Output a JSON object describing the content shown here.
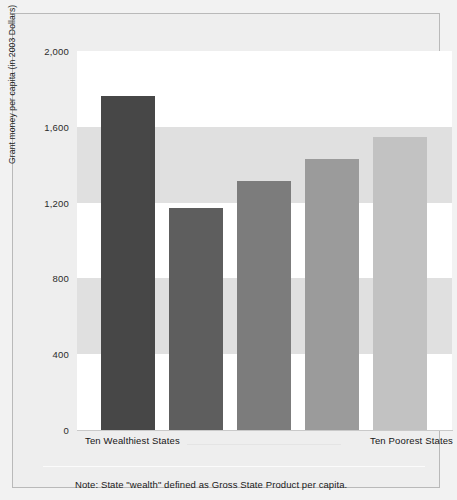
{
  "chart_data": {
    "type": "bar",
    "title": "",
    "xlabel": "",
    "ylabel": "Grant money per capita (in 2003 Dollars)",
    "ylim": [
      0,
      2000
    ],
    "yticks": [
      "0",
      "400",
      "800",
      "1,200",
      "1,600",
      "2,000"
    ],
    "ytick_values": [
      0,
      400,
      800,
      1200,
      1600,
      2000
    ],
    "grid": "horizontal alternating bands",
    "legend": "none",
    "categories": [
      "Ten Wealthiest States",
      "",
      "",
      "",
      "Ten Poorest States"
    ],
    "axis_endpoint_labels": {
      "left": "Ten Wealthiest States",
      "right": "Ten Poorest States"
    },
    "values": [
      1760,
      1170,
      1315,
      1430,
      1545
    ],
    "bar_colors": [
      "#474747",
      "#5e5e5e",
      "#7c7c7c",
      "#9b9b9b",
      "#c2c2c2"
    ],
    "bars": [
      {
        "value": 1760,
        "color": "#474747"
      },
      {
        "value": 1170,
        "color": "#5e5e5e"
      },
      {
        "value": 1315,
        "color": "#7c7c7c"
      },
      {
        "value": 1430,
        "color": "#9b9b9b"
      },
      {
        "value": 1545,
        "color": "#c2c2c2"
      }
    ],
    "bands": [
      {
        "from": 1600,
        "to": 2000,
        "color": "#ffffff"
      },
      {
        "from": 1200,
        "to": 1600,
        "color": "#e0e0e0"
      },
      {
        "from": 800,
        "to": 1200,
        "color": "#ffffff"
      },
      {
        "from": 400,
        "to": 800,
        "color": "#e0e0e0"
      },
      {
        "from": 0,
        "to": 400,
        "color": "#ffffff"
      }
    ],
    "annotations": [
      "Note: State \"wealth\" defined as Gross State Product per capita."
    ]
  },
  "note": "Note: State \"wealth\" defined as Gross State Product per capita.",
  "colors": {
    "figure_background": "#f2f2f2",
    "panel_background": "#eeeeee",
    "frame_border": "#b9b9b9",
    "band_light": "#ffffff",
    "band_gray": "#e0e0e0",
    "text": "#1a1a1a"
  }
}
